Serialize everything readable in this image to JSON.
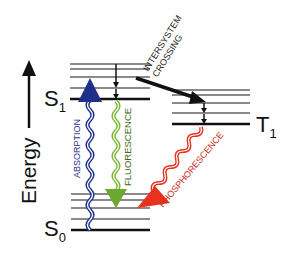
{
  "diagram": {
    "axis_label": "Energy",
    "states": {
      "s1": {
        "label": "S",
        "sub": "1"
      },
      "t1": {
        "label": "T",
        "sub": "1"
      },
      "s0": {
        "label": "S",
        "sub": "0"
      }
    },
    "processes": {
      "absorption": {
        "label": "ABSORPTION",
        "color": "#1f2f8a"
      },
      "fluorescence": {
        "label": "FLUORESCENCE",
        "color": "#7ab833"
      },
      "intersystem_crossing": {
        "line1": "INTERSYSTEM",
        "line2": "CROSSING",
        "color": "#111111"
      },
      "phosphorescence": {
        "label": "PHOSPHORESCENCE",
        "color": "#e8321e"
      }
    },
    "colors": {
      "vibrational_level": "#8a8a8a",
      "electronic_level": "#111111"
    }
  }
}
